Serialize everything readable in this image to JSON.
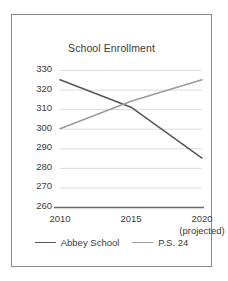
{
  "figure": {
    "border_color": "#8a8a8a",
    "background": "#ffffff"
  },
  "chart_data": {
    "type": "line",
    "title": "School Enrollment",
    "xlabel": "",
    "ylabel": "",
    "categories": [
      "2010",
      "2015",
      "2020"
    ],
    "x_tick_sublabels": [
      "",
      "",
      "(projected)"
    ],
    "ylim": [
      260,
      330
    ],
    "y_ticks": [
      260,
      270,
      280,
      290,
      300,
      310,
      320,
      330
    ],
    "grid": true,
    "grid_axis": "y",
    "legend_position": "bottom-center",
    "series": [
      {
        "name": "Abbey School",
        "values": [
          325,
          311,
          285
        ],
        "color": "#575757"
      },
      {
        "name": "P.S. 24",
        "values": [
          300,
          314,
          325
        ],
        "color": "#9b9b9b"
      }
    ]
  }
}
